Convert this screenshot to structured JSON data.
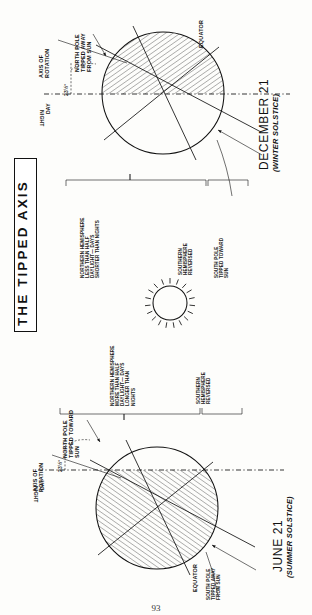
{
  "figure": {
    "title": "THE TIPPED AXIS",
    "page_number": "93",
    "sun_icon": "sun-icon"
  },
  "panels": [
    {
      "id": "december",
      "caption": "DECEMBER 21",
      "subcaption": "(WINTER SOLSTICE)",
      "axis_label": "AXIS OF\nROTATION",
      "tilt_angle": "23½°",
      "day_label": "DAY",
      "night_label": "NIGHT",
      "equator_label": "EQUATOR",
      "pole_top_label": "NORTH POLE\nTIPPED AWAY\nFROM SUN",
      "pole_bottom_label": "SOUTH POLE\nTIPPED TOWARD\nSUN",
      "hemisphere_note": "NORTHERN HEMISPHERE\nLESS THAN HALF\nDAYLIGHT— DAYS\nSHORTER THAN NIGHTS",
      "hemisphere_note_2": "SOUTHERN\nHEMISPHERE\nREVERSED"
    },
    {
      "id": "june",
      "caption": "JUNE 21",
      "subcaption": "(SUMMER SOLSTICE)",
      "axis_label": "AXIS OF\nROTATION",
      "tilt_angle": "23½°",
      "day_label": "DAY",
      "night_label": "NIGHT",
      "equator_label": "EQUATOR",
      "pole_top_label": "NORTH POLE\nTIPPED TOWARD\nSUN",
      "pole_bottom_label": "SOUTH POLE\nTIPPED AWAY\nFROM SUN",
      "hemisphere_note": "NORTHERN HEMISPHERE\nMORE THAN HALF\nDAYLIGHT— DAYS\nLONGER THAN\nNIGHTS",
      "hemisphere_note_2": "SOUTHERN\nHEMISPHERE\nREVERSED"
    }
  ],
  "colors": {
    "ink": "#111111",
    "paper": "#fdfdfb"
  }
}
